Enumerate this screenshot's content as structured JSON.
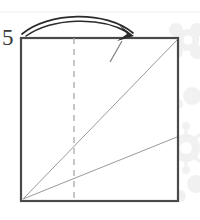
{
  "diagram": {
    "kind": "origami-fold-step",
    "step_label": "5",
    "canvas": {
      "width": 200,
      "height": 220,
      "background": "#ffffff"
    },
    "colors": {
      "paper_outline": "#4a4a4a",
      "crease_line": "#9a9a9a",
      "dashed_fold_line": "#a8a8a8",
      "arrow": "#2b2b2b",
      "partial_fold_tick": "#7d7d7d",
      "watermark": "#f0f0f0",
      "top_rule": "#ededed",
      "step_number": "#3a3a3a"
    },
    "paper_square": {
      "name": "paper-square",
      "left": 21,
      "top": 38,
      "right": 178,
      "bottom": 201,
      "stroke_width": 2.2
    },
    "dashed_fold_line": {
      "name": "vertical-center-fold-line",
      "x": 74,
      "y1": 38,
      "y2": 201,
      "dash": "6 5",
      "stroke_width": 1.3
    },
    "creases": [
      {
        "name": "diagonal-crease-corner-to-corner",
        "x1": 23,
        "y1": 199,
        "x2": 177,
        "y2": 40,
        "stroke_width": 1.0
      },
      {
        "name": "diagonal-crease-corner-to-right-edge",
        "x1": 23,
        "y1": 199,
        "x2": 177,
        "y2": 137,
        "stroke_width": 1.0
      }
    ],
    "partial_fold_tick": {
      "name": "partial-fold-tick",
      "x1": 110,
      "y1": 62,
      "x2": 122,
      "y2": 41,
      "stroke_width": 1.2
    },
    "fold_arrow": {
      "name": "fold-direction-arrow",
      "description": "curved arrow sweeping left to right over the top of the square",
      "outer_path": "M 22 34 C 48 12, 106 10, 133 33",
      "inner_path": "M 26 36 C 52 18, 100 16, 128 32",
      "head_points": "133 34 121 27 127 34 118 40",
      "stroke_width": 1.6
    },
    "top_rule": {
      "name": "top-hairline-rule",
      "y": 12,
      "x1": 0,
      "x2": 200
    },
    "watermark": {
      "name": "floral-watermark",
      "description": "faint grey floral / flower motif at right edge"
    }
  }
}
